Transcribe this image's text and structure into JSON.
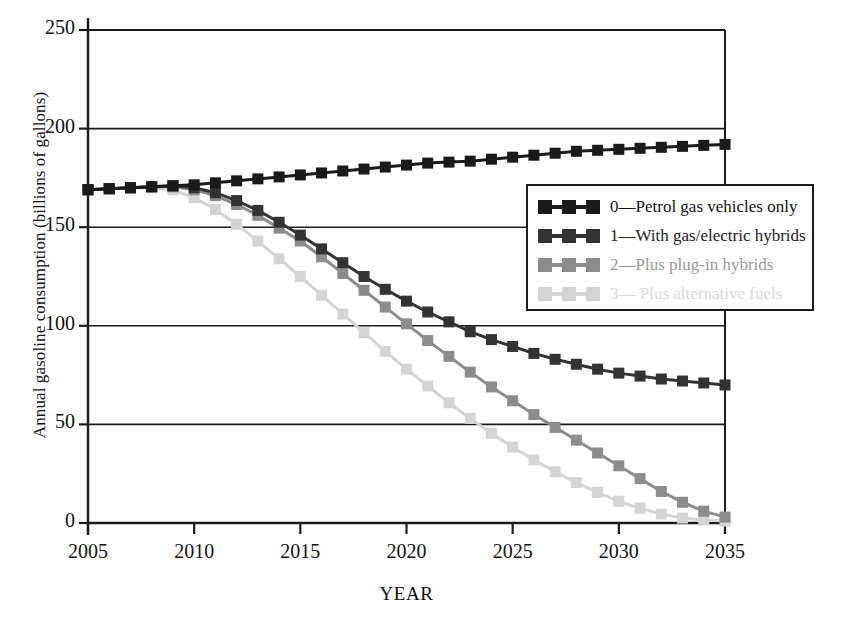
{
  "chart_data": {
    "type": "line",
    "title": "",
    "xlabel": "YEAR",
    "ylabel": "Annual gasoline consumption (billions of gallons)",
    "xlim": [
      2005,
      2035
    ],
    "ylim": [
      0,
      250
    ],
    "xticks": [
      2005,
      2010,
      2015,
      2020,
      2025,
      2030,
      2035
    ],
    "yticks": [
      0,
      50,
      100,
      150,
      200,
      250
    ],
    "grid": "horizontal",
    "legend_position": "center-right",
    "marker": "square",
    "x": [
      2005,
      2006,
      2007,
      2008,
      2009,
      2010,
      2011,
      2012,
      2013,
      2014,
      2015,
      2016,
      2017,
      2018,
      2019,
      2020,
      2021,
      2022,
      2023,
      2024,
      2025,
      2026,
      2027,
      2028,
      2029,
      2030,
      2031,
      2032,
      2033,
      2034,
      2035
    ],
    "series": [
      {
        "name": "0—Petrol gas vehicles only",
        "color": "#1a1a1a",
        "values": [
          169,
          169.5,
          170,
          170.5,
          171,
          171.5,
          172.5,
          173.5,
          174.5,
          175.5,
          176.5,
          177.5,
          178.5,
          179.5,
          180.5,
          181.5,
          182.5,
          183,
          183.5,
          184.5,
          185.5,
          186.5,
          187.5,
          188.5,
          189,
          189.5,
          190,
          190.5,
          191,
          191.5,
          192
        ]
      },
      {
        "name": "1—With gas/electric hybrids",
        "color": "#333333",
        "values": [
          169,
          169.5,
          170,
          170.5,
          171,
          170,
          167.5,
          163.5,
          158.5,
          152.5,
          146,
          139,
          132,
          125,
          118.5,
          112.5,
          107,
          102,
          97,
          93,
          89.5,
          86,
          83,
          80.5,
          78,
          76,
          74.5,
          73,
          72,
          71,
          70
        ]
      },
      {
        "name": "2—Plus plug-in hybrids",
        "color": "#8c8c8c",
        "values": [
          169,
          169.5,
          170,
          170.5,
          170.5,
          169,
          166,
          161.5,
          156,
          149.5,
          143,
          135,
          126.5,
          118,
          109.5,
          101,
          92.5,
          84.5,
          76.5,
          69,
          62,
          55,
          48.5,
          42,
          35.5,
          29,
          22.5,
          16,
          10.5,
          6,
          3
        ]
      },
      {
        "name": "3— Plus alternative fuels",
        "color": "#d4d4d4",
        "values": [
          169,
          169.5,
          170,
          170,
          169,
          165,
          159,
          151.5,
          143,
          134,
          125,
          115.5,
          106,
          96.5,
          87,
          78,
          69.5,
          61,
          53,
          45.5,
          38.5,
          32,
          26,
          20.5,
          15.5,
          11,
          7.5,
          4.5,
          2.5,
          1.5,
          1
        ]
      }
    ]
  },
  "axis": {
    "xtick_labels": [
      "2005",
      "2010",
      "2015",
      "2020",
      "2025",
      "2030",
      "2035"
    ],
    "ytick_labels": [
      "0",
      "50",
      "100",
      "150",
      "200",
      "250"
    ]
  }
}
